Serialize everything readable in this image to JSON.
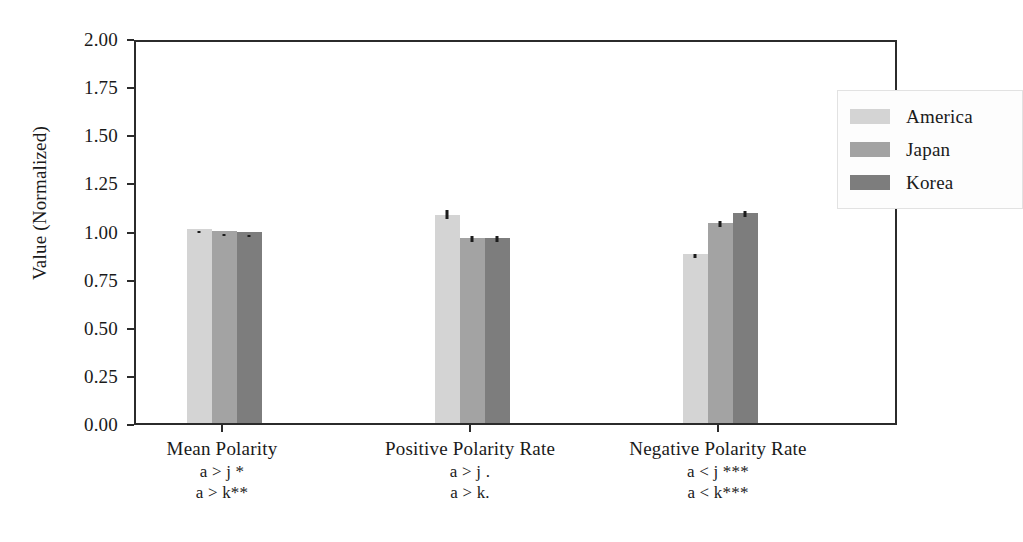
{
  "chart_data": {
    "type": "bar",
    "title": "",
    "xlabel": "",
    "ylabel": "Value (Normalized)",
    "ylim": [
      0.0,
      2.0
    ],
    "ytick_labels": [
      "0.00",
      "0.25",
      "0.50",
      "0.75",
      "1.00",
      "1.25",
      "1.50",
      "1.75",
      "2.00"
    ],
    "ytick_values": [
      0.0,
      0.25,
      0.5,
      0.75,
      1.0,
      1.25,
      1.5,
      1.75,
      2.0
    ],
    "grid": false,
    "legend_position": "upper right",
    "categories": [
      "Mean Polarity",
      "Positive Polarity Rate",
      "Negative Polarity Rate"
    ],
    "series": [
      {
        "name": "America",
        "color": "#d4d4d4",
        "values": [
          1.01,
          1.08,
          0.88
        ],
        "errors": [
          0.01,
          0.045,
          0.02
        ]
      },
      {
        "name": "Japan",
        "color": "#a3a3a3",
        "values": [
          1.0,
          0.96,
          1.04
        ],
        "errors": [
          0.005,
          0.03,
          0.03
        ]
      },
      {
        "name": "Korea",
        "color": "#7d7d7d",
        "values": [
          0.99,
          0.96,
          1.09
        ],
        "errors": [
          0.008,
          0.03,
          0.03
        ]
      }
    ],
    "group_annotations": [
      {
        "category": "Mean Polarity",
        "lines": [
          "a > j *",
          "a > k**"
        ]
      },
      {
        "category": "Positive Polarity Rate",
        "lines": [
          "a > j .",
          "a > k."
        ]
      },
      {
        "category": "Negative Polarity Rate",
        "lines": [
          "a < j ***",
          "a < k***"
        ]
      }
    ]
  },
  "legend": {
    "items": [
      {
        "label": "America",
        "color": "#d4d4d4"
      },
      {
        "label": "Japan",
        "color": "#a3a3a3"
      },
      {
        "label": "Korea",
        "color": "#7d7d7d"
      }
    ]
  },
  "axes": {
    "y_title": "Value (Normalized)"
  }
}
